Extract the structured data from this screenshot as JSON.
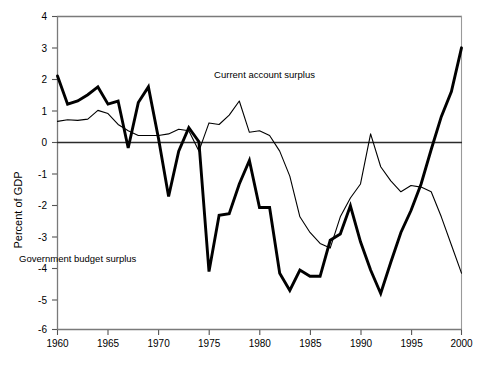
{
  "chart_data": {
    "type": "line",
    "title": "",
    "xlabel": "",
    "ylabel": "Percent of GDP",
    "xlim": [
      1960,
      2000
    ],
    "ylim": [
      -6,
      4
    ],
    "grid": false,
    "legend_position": "inline-annotations",
    "x_ticks": [
      "1960",
      "1965",
      "1970",
      "1975",
      "1980",
      "1985",
      "1990",
      "1995",
      "2000"
    ],
    "y_ticks": [
      "4",
      "3",
      "2",
      "1",
      "0",
      "-1",
      "-2",
      "-3",
      "-4",
      "-5",
      "-6"
    ],
    "x": [
      1960,
      1961,
      1962,
      1963,
      1964,
      1965,
      1966,
      1967,
      1968,
      1969,
      1970,
      1971,
      1972,
      1973,
      1974,
      1975,
      1976,
      1977,
      1978,
      1979,
      1980,
      1981,
      1982,
      1983,
      1984,
      1985,
      1986,
      1987,
      1988,
      1989,
      1990,
      1991,
      1992,
      1993,
      1994,
      1995,
      1996,
      1997,
      1998,
      1999,
      2000
    ],
    "series": [
      {
        "name": "Government budget surplus",
        "style": "thick",
        "color": "#000000",
        "values": [
          2.1,
          1.2,
          1.3,
          1.5,
          1.75,
          1.2,
          1.3,
          -0.2,
          1.25,
          1.75,
          0.1,
          -1.75,
          -0.3,
          0.45,
          0.0,
          -4.15,
          -2.35,
          -2.3,
          -1.35,
          -0.6,
          -2.1,
          -2.1,
          -4.2,
          -4.75,
          -4.1,
          -4.3,
          -4.3,
          -3.15,
          -2.95,
          -2.05,
          -3.2,
          -4.1,
          -4.85,
          -3.85,
          -2.9,
          -2.2,
          -1.35,
          -0.25,
          0.8,
          1.6,
          3.0
        ]
      },
      {
        "name": "Current account surplus",
        "style": "thin",
        "color": "#000000",
        "values": [
          0.65,
          0.7,
          0.68,
          0.72,
          1.0,
          0.9,
          0.55,
          0.35,
          0.2,
          0.2,
          0.2,
          0.25,
          0.4,
          0.35,
          -0.3,
          0.6,
          0.55,
          0.85,
          1.3,
          0.3,
          0.35,
          0.2,
          -0.3,
          -1.1,
          -2.4,
          -2.9,
          -3.25,
          -3.4,
          -2.4,
          -1.8,
          -1.35,
          0.25,
          -0.8,
          -1.25,
          -1.6,
          -1.4,
          -1.45,
          -1.6,
          -2.4,
          -3.3,
          -4.2
        ]
      }
    ],
    "annotations": [
      {
        "id": "current-account-label",
        "text": "Current account surplus",
        "x": 1980.5,
        "y": 2.05
      },
      {
        "id": "government-budget-label",
        "text": "Government  budget  surplus",
        "x": 1962.0,
        "y": -3.85
      }
    ]
  },
  "caption": {
    "text": ""
  }
}
